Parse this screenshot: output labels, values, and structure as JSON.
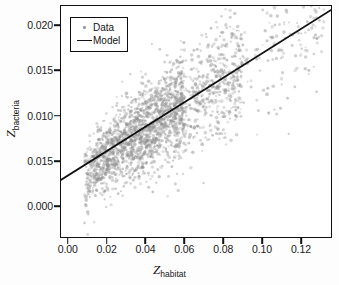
{
  "figure": {
    "background_color": "#fdfdfd",
    "plot_background_color": "#ffffff",
    "frame_color": "#111111"
  },
  "chart_data": {
    "type": "scatter",
    "title": "",
    "xlabel": "Z_habitat",
    "ylabel": "Z_bacteria",
    "xlabel_var": "Z",
    "xlabel_sub": "habitat",
    "ylabel_var": "Z",
    "ylabel_sub": "bacteria",
    "grid": false,
    "legend_position": "upper left",
    "xlim": [
      -0.004,
      0.136
    ],
    "ylim": [
      -0.0035,
      0.0222
    ],
    "xticks": [
      0.0,
      0.02,
      0.04,
      0.06,
      0.08,
      0.1,
      0.12
    ],
    "xticklabels": [
      "0.00",
      "0.02",
      "0.04",
      "0.06",
      "0.08",
      "0.10",
      "0.12"
    ],
    "yticks": [
      0.0,
      0.005,
      0.01,
      0.015,
      0.02
    ],
    "yticklabels": [
      "0.000",
      "0.015",
      "0.010",
      "0.015",
      "0.020"
    ],
    "point_color": "#8f8f8f",
    "point_opacity": 0.45,
    "point_size_px": 2.6,
    "n_points": 2400,
    "series": [
      {
        "name": "Data",
        "marker": "dot",
        "color": "#8f8f8f",
        "description": "dense diagonal cloud of gray scatter points rising from lower-left to upper-right, widest between x=0.02 and x=0.08, sparse tail beyond x=0.09"
      },
      {
        "name": "Model",
        "marker": "line",
        "color": "#111111",
        "line_width_px": 1.8,
        "description": "straight regression line",
        "line_endpoints": [
          [
            -0.004,
            0.00285
          ],
          [
            0.136,
            0.02175
          ]
        ],
        "slope": 0.135,
        "intercept": 0.00339
      }
    ],
    "cloud_points_sample": [
      [
        0.008,
        0.001
      ],
      [
        0.009,
        0.0003
      ],
      [
        0.01,
        0.002
      ],
      [
        0.011,
        0.0028
      ],
      [
        0.012,
        0.0035
      ],
      [
        0.013,
        0.0042
      ],
      [
        0.014,
        0.005
      ],
      [
        0.015,
        0.0058
      ],
      [
        0.017,
        0.0064
      ],
      [
        0.018,
        0.0072
      ],
      [
        0.02,
        0.0078
      ],
      [
        0.021,
        0.0085
      ],
      [
        0.023,
        0.009
      ],
      [
        0.025,
        0.0095
      ],
      [
        0.027,
        0.01
      ],
      [
        0.029,
        0.0083
      ],
      [
        0.031,
        0.0088
      ],
      [
        0.033,
        0.0093
      ],
      [
        0.035,
        0.0098
      ],
      [
        0.037,
        0.0105
      ],
      [
        0.039,
        0.011
      ],
      [
        0.041,
        0.0115
      ],
      [
        0.043,
        0.012
      ],
      [
        0.045,
        0.0125
      ],
      [
        0.047,
        0.013
      ],
      [
        0.05,
        0.0135
      ],
      [
        0.053,
        0.014
      ],
      [
        0.056,
        0.0148
      ],
      [
        0.059,
        0.0155
      ],
      [
        0.062,
        0.016
      ],
      [
        0.065,
        0.0165
      ],
      [
        0.068,
        0.015
      ],
      [
        0.071,
        0.014
      ],
      [
        0.074,
        0.013
      ],
      [
        0.078,
        0.0125
      ],
      [
        0.082,
        0.014
      ],
      [
        0.086,
        0.0155
      ],
      [
        0.09,
        0.015
      ],
      [
        0.095,
        0.0148
      ],
      [
        0.1,
        0.0155
      ],
      [
        0.105,
        0.0165
      ],
      [
        0.11,
        0.0172
      ],
      [
        0.118,
        0.016
      ],
      [
        0.124,
        0.018
      ]
    ]
  },
  "legend": {
    "entries": [
      {
        "label": "Data",
        "key": "dot",
        "color": "#9a9a9a"
      },
      {
        "label": "Model",
        "key": "line",
        "color": "#111111"
      }
    ]
  }
}
